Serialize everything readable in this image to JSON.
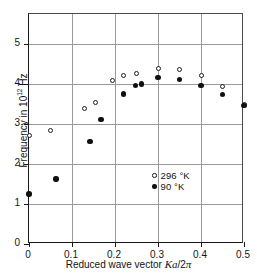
{
  "chart_data": {
    "type": "scatter",
    "title": "",
    "xlabel": "Reduced wave vector Ka/2π",
    "ylabel": "Frequency in 10¹² Hz",
    "xlim": [
      0,
      0.5
    ],
    "ylim": [
      0,
      5.75
    ],
    "xticks": [
      0,
      0.1,
      0.2,
      0.3,
      0.4,
      0.5
    ],
    "xtick_labels": [
      "0",
      "0.1",
      "0.2",
      "0.3",
      "0.4",
      "0.5"
    ],
    "yticks": [
      0,
      1,
      2,
      3,
      4,
      5
    ],
    "ytick_labels": [
      "0",
      "1",
      "2",
      "3",
      "4",
      "5"
    ],
    "grid": "both",
    "legend_position": "center-right",
    "series": [
      {
        "name": "296 °K",
        "marker": "open-circle",
        "color": "#1c1c1c",
        "points": [
          [
            0.0,
            2.72
          ],
          [
            0.05,
            2.85
          ],
          [
            0.13,
            3.38
          ],
          [
            0.155,
            3.53
          ],
          [
            0.195,
            4.1
          ],
          [
            0.22,
            4.21
          ],
          [
            0.25,
            4.27
          ],
          [
            0.3,
            4.39
          ],
          [
            0.35,
            4.37
          ],
          [
            0.4,
            4.22
          ],
          [
            0.45,
            3.95
          ],
          [
            0.5,
            3.5
          ]
        ]
      },
      {
        "name": "90 °K",
        "marker": "filled-circle",
        "color": "#101010",
        "points": [
          [
            0.0,
            1.25
          ],
          [
            0.063,
            1.63
          ],
          [
            0.142,
            2.57
          ],
          [
            0.167,
            3.11
          ],
          [
            0.22,
            3.75
          ],
          [
            0.248,
            3.96
          ],
          [
            0.262,
            4.0
          ],
          [
            0.3,
            4.17
          ],
          [
            0.35,
            4.11
          ],
          [
            0.4,
            3.97
          ],
          [
            0.45,
            3.74
          ],
          [
            0.5,
            3.46
          ]
        ]
      }
    ]
  },
  "axis": {
    "x_title_prefix": "Reduced wave vector ",
    "x_title_symbol_k": "Ka",
    "x_title_slash": "/2",
    "x_title_pi": "π",
    "y_title_prefix": "Frequency in 10",
    "y_title_exponent": "12",
    "y_title_suffix": " Hz"
  },
  "legend": {
    "entries": [
      {
        "label": "296 °K",
        "marker": "open-circle"
      },
      {
        "label": "90 °K",
        "marker": "filled-circle"
      }
    ]
  }
}
